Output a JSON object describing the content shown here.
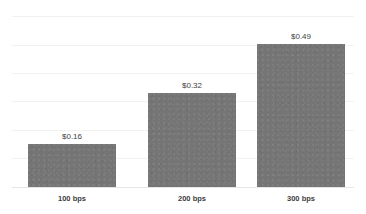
{
  "chart_data": {
    "type": "bar",
    "title": "",
    "subtitle": "",
    "xlabel": "",
    "ylabel": "",
    "categories": [
      "100 bps",
      "200 bps",
      "300 bps"
    ],
    "values": [
      0.16,
      0.32,
      0.49
    ],
    "value_labels": [
      "$0.16",
      "$0.32",
      "$0.49"
    ],
    "series": [
      {
        "name": "",
        "values": [
          0.16,
          0.32,
          0.49
        ]
      }
    ],
    "ylim": [
      0,
      0.6
    ],
    "grid": true,
    "gridlines_count": 6,
    "legend": false,
    "legend_position": "none",
    "bar_color": "#757575",
    "gridline_color": "#f2f2f2",
    "axis_line_color": "#e6e6e6",
    "background_color": "#ffffff",
    "label_color": "#404040",
    "category_label_color": "#3d3d3d"
  },
  "bars": [
    {
      "category": "100 bps",
      "value_label": "$0.16",
      "left": 28,
      "width": 88,
      "top": 144,
      "height": 43
    },
    {
      "category": "200 bps",
      "value_label": "$0.32",
      "left": 148,
      "width": 88,
      "top": 93,
      "height": 94
    },
    {
      "category": "300 bps",
      "value_label": "$0.49",
      "left": 257,
      "width": 88,
      "top": 44,
      "height": 143
    }
  ],
  "gridlines": [
    {
      "y": 16
    },
    {
      "y": 45
    },
    {
      "y": 73
    },
    {
      "y": 101
    },
    {
      "y": 130
    },
    {
      "y": 158
    }
  ]
}
